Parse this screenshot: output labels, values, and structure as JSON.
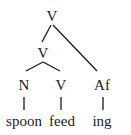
{
  "tree": {
    "root": {
      "label": "V"
    },
    "inner": {
      "label": "V"
    },
    "leaves": [
      {
        "category": "N",
        "word": "spoon"
      },
      {
        "category": "V",
        "word": "feed"
      },
      {
        "category": "Af",
        "word": "ing"
      }
    ]
  }
}
